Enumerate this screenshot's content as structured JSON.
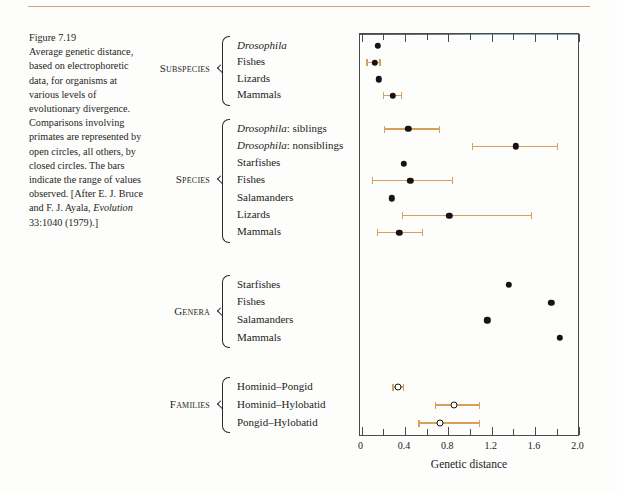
{
  "figure": {
    "number": "Figure 7.19",
    "caption_lines": [
      "Average genetic distance,",
      "based on electrophoretic",
      "data, for organisms at",
      "various levels of",
      "evolutionary divergence.",
      "Comparisons involving",
      "primates are represented by",
      "open circles, all others, by",
      "closed circles. The bars",
      "indicate the range of values",
      "observed. [After E. J. Bruce"
    ],
    "caption_tail_pre": "and F. J. Ayala, ",
    "caption_tail_italic": "Evolution",
    "caption_tail_post": "33:1040 (1979).]"
  },
  "colors": {
    "range_bar": "#d9a05b",
    "dot_closed": "#141414",
    "dot_open_fill": "#fdfdfb",
    "frame": "#4a4a4a",
    "top_rule": "#c8a96a",
    "page_bg": "#fdfdfb"
  },
  "chart_data": {
    "type": "scatter",
    "xlabel": "Genetic distance",
    "ylabel": "",
    "xlim": [
      0,
      2.0
    ],
    "xticks": [
      0,
      0.2,
      0.4,
      0.6,
      0.8,
      1.0,
      1.2,
      1.4,
      1.6,
      1.8,
      2.0
    ],
    "xtick_labels": [
      "0",
      "0.4",
      "0.8",
      "1.2",
      "1.6",
      "2.0"
    ],
    "xtick_label_values": [
      0,
      0.4,
      0.8,
      1.2,
      1.6,
      2.0
    ],
    "grid": false,
    "legend": "none",
    "marker_note": "open circles = primate comparisons; closed circles = all others; bars = range of values observed",
    "groups": [
      {
        "name": "Subspecies",
        "rows": [
          {
            "label": "Drosophila",
            "italic_prefix": "Drosophila",
            "plain_suffix": "",
            "value": 0.15,
            "range": null,
            "marker": "closed"
          },
          {
            "label": "Fishes",
            "italic_prefix": "",
            "plain_suffix": "Fishes",
            "value": 0.12,
            "range": [
              0.05,
              0.17
            ],
            "marker": "closed"
          },
          {
            "label": "Lizards",
            "italic_prefix": "",
            "plain_suffix": "Lizards",
            "value": 0.16,
            "range": null,
            "marker": "closed"
          },
          {
            "label": "Mammals",
            "italic_prefix": "",
            "plain_suffix": "Mammals",
            "value": 0.29,
            "range": [
              0.2,
              0.37
            ],
            "marker": "closed"
          }
        ]
      },
      {
        "name": "Species",
        "rows": [
          {
            "label": "Drosophila: siblings",
            "italic_prefix": "Drosophila",
            "plain_suffix": ": siblings",
            "value": 0.43,
            "range": [
              0.21,
              0.72
            ],
            "marker": "closed"
          },
          {
            "label": "Drosophila: nonsiblings",
            "italic_prefix": "Drosophila",
            "plain_suffix": ": nonsiblings",
            "value": 1.42,
            "range": [
              1.02,
              1.81
            ],
            "marker": "closed"
          },
          {
            "label": "Starfishes",
            "italic_prefix": "",
            "plain_suffix": "Starfishes",
            "value": 0.39,
            "range": null,
            "marker": "closed"
          },
          {
            "label": "Fishes",
            "italic_prefix": "",
            "plain_suffix": "Fishes",
            "value": 0.45,
            "range": [
              0.1,
              0.84
            ],
            "marker": "closed"
          },
          {
            "label": "Salamanders",
            "italic_prefix": "",
            "plain_suffix": "Salamanders",
            "value": 0.28,
            "range": null,
            "marker": "closed"
          },
          {
            "label": "Lizards",
            "italic_prefix": "",
            "plain_suffix": "Lizards",
            "value": 0.81,
            "range": [
              0.38,
              1.57
            ],
            "marker": "closed"
          },
          {
            "label": "Mammals",
            "italic_prefix": "",
            "plain_suffix": "Mammals",
            "value": 0.35,
            "range": [
              0.15,
              0.56
            ],
            "marker": "closed"
          }
        ]
      },
      {
        "name": "Genera",
        "rows": [
          {
            "label": "Starfishes",
            "italic_prefix": "",
            "plain_suffix": "Starfishes",
            "value": 1.36,
            "range": null,
            "marker": "closed"
          },
          {
            "label": "Fishes",
            "italic_prefix": "",
            "plain_suffix": "Fishes",
            "value": 1.75,
            "range": null,
            "marker": "closed"
          },
          {
            "label": "Salamanders",
            "italic_prefix": "",
            "plain_suffix": "Salamanders",
            "value": 1.16,
            "range": null,
            "marker": "closed"
          },
          {
            "label": "Mammals",
            "italic_prefix": "",
            "plain_suffix": "Mammals",
            "value": 1.83,
            "range": null,
            "marker": "closed"
          }
        ]
      },
      {
        "name": "Families",
        "rows": [
          {
            "label": "Hominid–Pongid",
            "italic_prefix": "",
            "plain_suffix": "Hominid–Pongid",
            "value": 0.34,
            "range": [
              0.29,
              0.39
            ],
            "marker": "open"
          },
          {
            "label": "Hominid–Hylobatid",
            "italic_prefix": "",
            "plain_suffix": "Hominid–Hylobatid",
            "value": 0.85,
            "range": [
              0.68,
              1.09
            ],
            "marker": "open"
          },
          {
            "label": "Pongid–Hylobatid",
            "italic_prefix": "",
            "plain_suffix": "Pongid–Hylobatid",
            "value": 0.72,
            "range": [
              0.53,
              1.09
            ],
            "marker": "open"
          }
        ]
      }
    ]
  }
}
